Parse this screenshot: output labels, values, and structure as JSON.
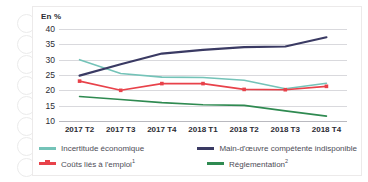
{
  "chart_data": {
    "type": "line",
    "title": "",
    "subtitle": "",
    "unit_label": "En %",
    "xlabel": "",
    "ylabel": "En %",
    "categories": [
      "2017 T2",
      "2017 T3",
      "2017 T4",
      "2018 T1",
      "2018 T2",
      "2018 T3",
      "2018 T4"
    ],
    "ylim": [
      10,
      40
    ],
    "yticks": [
      40,
      35,
      30,
      25,
      20,
      15,
      10
    ],
    "grid": true,
    "legend_position": "bottom",
    "series": [
      {
        "name": "Incertitude économique",
        "color": "#74c3b8",
        "markers": false,
        "values": [
          30.0,
          25.5,
          24.3,
          24.2,
          23.3,
          20.5,
          22.3
        ]
      },
      {
        "name": "Main-d'œuvre compétente indisponible",
        "color": "#3a3a63",
        "markers": false,
        "values": [
          24.8,
          28.5,
          32.0,
          33.2,
          34.1,
          34.3,
          37.3
        ]
      },
      {
        "name": "Coûts liés à l'emploi",
        "footnote": "1",
        "color": "#e8424a",
        "markers": true,
        "values": [
          23.0,
          20.0,
          22.2,
          22.2,
          20.3,
          20.2,
          21.3
        ]
      },
      {
        "name": "Réglementation",
        "footnote": "2",
        "color": "#2f8a51",
        "markers": false,
        "values": [
          18.0,
          17.0,
          16.0,
          15.3,
          15.1,
          13.3,
          11.6
        ]
      }
    ]
  },
  "figure": {
    "unit_label": "En %"
  },
  "legend": {
    "items": [
      {
        "label": "Incertitude économique",
        "footnote": ""
      },
      {
        "label": "Main-d'œuvre compétente indisponible",
        "footnote": ""
      },
      {
        "label": "Coûts liés à l'emploi",
        "footnote": "1"
      },
      {
        "label": "Réglementation",
        "footnote": "2"
      }
    ]
  }
}
